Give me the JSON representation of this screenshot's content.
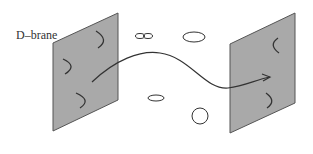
{
  "diagram": {
    "label": "D–brane",
    "colors": {
      "brane_fill": "#a9a9a9",
      "brane_edge": "#555555",
      "stroke": "#333333",
      "background": "#ffffff"
    },
    "branes": [
      {
        "id": "left",
        "points": "53,43 118,13 118,100 53,131",
        "open_strings": [
          {
            "path": "M96,31 Q110,40 98,48"
          },
          {
            "path": "M63,59 Q78,66 65,74"
          },
          {
            "path": "M76,93 Q92,100 80,108"
          }
        ]
      },
      {
        "id": "right",
        "points": "230,44 295,13 295,103 230,133",
        "open_strings": [
          {
            "path": "M278,38 Q268,45 279,53"
          },
          {
            "path": "M266,93 Q277,101 267,108"
          }
        ]
      }
    ],
    "closed_strings": [
      {
        "type": "figure-eight",
        "cx": 144,
        "cy": 36
      },
      {
        "type": "ellipse",
        "cx": 194,
        "cy": 37,
        "rx": 11,
        "ry": 5
      },
      {
        "type": "ellipse",
        "cx": 156,
        "cy": 98,
        "rx": 8,
        "ry": 3
      },
      {
        "type": "circle",
        "cx": 200,
        "cy": 116,
        "r": 8
      }
    ],
    "propagating_string": {
      "path": "M92,82 C115,60 140,50 160,53 C190,57 205,90 228,88 C245,86 255,80 270,77",
      "arrow": "M262,74 L270,77 L263,81"
    }
  }
}
